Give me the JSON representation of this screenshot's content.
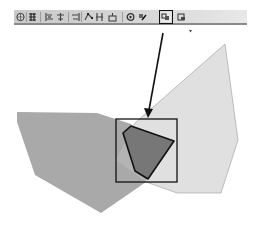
{
  "toolbar": {
    "buttons": [
      {
        "icon": "globe-settings-icon",
        "x": 2
      },
      {
        "icon": "snap-grid-icon",
        "x": 14
      },
      {
        "icon": "align-left-icon",
        "x": 31
      },
      {
        "icon": "align-center-icon",
        "x": 42
      },
      {
        "icon": "align-right-icon",
        "x": 57
      },
      {
        "icon": "edit-vertices-icon",
        "x": 70
      },
      {
        "icon": "split-icon",
        "x": 81
      },
      {
        "icon": "merge-icon",
        "x": 94
      },
      {
        "icon": "reshape-icon",
        "x": 112
      },
      {
        "icon": "edit-sketch-icon",
        "x": 124
      },
      {
        "icon": "clip-icon",
        "x": 147,
        "active": true
      },
      {
        "icon": "intersect-icon",
        "x": 163
      }
    ],
    "separators": [
      12,
      26,
      54,
      67,
      108
    ],
    "overflow_icon": "chevron-down-icon"
  },
  "diagram": {
    "colors": {
      "left_polygon": "#a9a9a9",
      "right_polygon": "#e0e0e0",
      "overlap": "#bdbdbd",
      "clip_result": "#777777",
      "stroke": "#111111"
    },
    "left_polygon_points": "17,112 97,113 131,124 152,150 146,182 101,213 35,175 17,122",
    "right_polygon_points": "135,123 225,44 238,140 221,193 177,193 146,182 116,160",
    "clip_rectangle": {
      "x": 116,
      "y": 119,
      "width": 61,
      "height": 63
    },
    "clip_result_points": "123,133 131,126 174,141 148,179 135,171",
    "arrow": {
      "x1": 163,
      "y1": 33,
      "x2": 149,
      "y2": 110,
      "tip": "148,118 144,108 153,109"
    }
  }
}
